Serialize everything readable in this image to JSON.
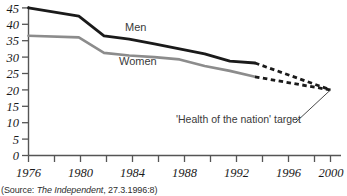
{
  "chart_data": {
    "type": "line",
    "title": "",
    "xlabel": "",
    "ylabel": "",
    "xlim": [
      1976,
      2000
    ],
    "ylim": [
      0,
      45
    ],
    "grid": false,
    "legend_position": "inline-labels",
    "x_ticks": [
      1976,
      1980,
      1984,
      1988,
      1992,
      1996,
      2000
    ],
    "x_minor_tick_step": 2,
    "y_ticks": [
      0,
      5,
      10,
      15,
      20,
      25,
      30,
      35,
      40,
      45
    ],
    "x_tick_labels": [
      "1976",
      "1980",
      "1984",
      "1988",
      "1992",
      "1996",
      "2000"
    ],
    "y_tick_labels": [
      "0",
      "5",
      "10",
      "15",
      "20",
      "25",
      "30",
      "35",
      "40",
      "45"
    ],
    "series": [
      {
        "name": "Men",
        "color": "#1a1a1a",
        "style": "solid",
        "x": [
          1976,
          1980,
          1982,
          1984,
          1986,
          1988,
          1990,
          1992,
          1994
        ],
        "values": [
          45.0,
          42.5,
          36.5,
          35.5,
          34.0,
          32.5,
          31.0,
          28.8,
          28.2
        ]
      },
      {
        "name": "Women",
        "color": "#8c8c8c",
        "style": "solid",
        "x": [
          1976,
          1980,
          1982,
          1984,
          1986,
          1988,
          1990,
          1992,
          1994
        ],
        "values": [
          36.5,
          36.0,
          31.3,
          30.5,
          30.0,
          29.3,
          27.3,
          25.8,
          24.0
        ]
      },
      {
        "name": "Men projection",
        "color": "#1a1a1a",
        "style": "dashed",
        "x": [
          1994,
          2000
        ],
        "values": [
          28.2,
          20.0
        ]
      },
      {
        "name": "Women projection",
        "color": "#1a1a1a",
        "style": "dashed",
        "x": [
          1994,
          2000
        ],
        "values": [
          24.0,
          20.0
        ]
      }
    ],
    "annotations": [
      {
        "name": "men-label",
        "text": "Men",
        "x": 1984.0,
        "y": 37.5
      },
      {
        "name": "women-label",
        "text": "Women",
        "x": 1984.0,
        "y": 27.5
      },
      {
        "name": "target-label",
        "text": "'Health of the nation' target",
        "x": 1992.0,
        "y": 10.5,
        "points_to_x": 2000,
        "points_to_y": 20
      }
    ]
  },
  "source": {
    "prefix": "(Source: ",
    "publication": "The Independent",
    "suffix": ", 27.3.1996:8)"
  }
}
